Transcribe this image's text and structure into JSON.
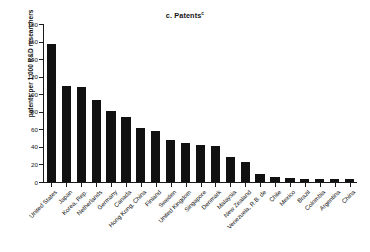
{
  "chart_data": {
    "type": "bar",
    "title": "c. Patents",
    "title_superscript": "c",
    "xlabel": "",
    "ylabel": "patents per 1,000 R&D researchers",
    "ylim": [
      0,
      180
    ],
    "yticks": [
      0,
      20,
      40,
      60,
      80,
      100,
      120,
      140,
      160,
      180
    ],
    "grid": false,
    "legend": null,
    "bar_color": "#111111",
    "categories": [
      "United States",
      "Japan",
      "Korea, Rep.",
      "Netherlands",
      "Germany",
      "Canada",
      "Hong Kong, China",
      "Finland",
      "Sweden",
      "United Kingdom",
      "Singapore",
      "Denmark",
      "Malaysia",
      "New Zealand",
      "Venezuela, R.B. de",
      "Chile",
      "Mexico",
      "Brazil",
      "Colombia",
      "Argentina",
      "China"
    ],
    "values": [
      157,
      109,
      108,
      93,
      81,
      74,
      61,
      58,
      48,
      45,
      42,
      41,
      28,
      23,
      9,
      6,
      5,
      4,
      4,
      4,
      4
    ]
  }
}
